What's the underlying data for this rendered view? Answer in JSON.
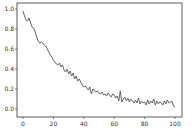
{
  "chart_data": {
    "type": "line",
    "title": "",
    "xlabel": "",
    "ylabel": "",
    "xlim": [
      -5,
      105
    ],
    "ylim": [
      -0.04,
      1.06
    ],
    "xticks": [
      0,
      20,
      40,
      60,
      80,
      100
    ],
    "xtick_labels": [
      "0",
      "20",
      "40",
      "60",
      "80",
      "100"
    ],
    "yticks": [
      0.0,
      0.2,
      0.4,
      0.6,
      0.8,
      1.0
    ],
    "ytick_labels": [
      "0.0",
      "0.2",
      "0.4",
      "0.6",
      "0.8",
      "1.0"
    ],
    "grid": false,
    "legend": null,
    "series": [
      {
        "name": "series",
        "color": "#555555",
        "x": [
          0,
          1,
          2,
          3,
          4,
          5,
          6,
          7,
          8,
          9,
          10,
          11,
          12,
          13,
          14,
          15,
          16,
          17,
          18,
          19,
          20,
          21,
          22,
          23,
          24,
          25,
          26,
          27,
          28,
          29,
          30,
          31,
          32,
          33,
          34,
          35,
          36,
          37,
          38,
          39,
          40,
          41,
          42,
          43,
          44,
          45,
          46,
          47,
          48,
          49,
          50,
          51,
          52,
          53,
          54,
          55,
          56,
          57,
          58,
          59,
          60,
          61,
          62,
          63,
          64,
          65,
          66,
          67,
          68,
          69,
          70,
          71,
          72,
          73,
          74,
          75,
          76,
          77,
          78,
          79,
          80,
          81,
          82,
          83,
          84,
          85,
          86,
          87,
          88,
          89,
          90,
          91,
          92,
          93,
          94,
          95,
          96,
          97,
          98,
          99,
          100
        ],
        "values": [
          0.98,
          0.93,
          0.89,
          0.88,
          0.91,
          0.86,
          0.82,
          0.81,
          0.77,
          0.72,
          0.68,
          0.66,
          0.67,
          0.66,
          0.64,
          0.63,
          0.6,
          0.57,
          0.54,
          0.52,
          0.49,
          0.47,
          0.45,
          0.44,
          0.46,
          0.42,
          0.44,
          0.39,
          0.37,
          0.4,
          0.35,
          0.38,
          0.33,
          0.36,
          0.3,
          0.33,
          0.28,
          0.3,
          0.27,
          0.24,
          0.22,
          0.23,
          0.21,
          0.19,
          0.22,
          0.15,
          0.2,
          0.18,
          0.17,
          0.18,
          0.16,
          0.15,
          0.17,
          0.14,
          0.15,
          0.13,
          0.16,
          0.14,
          0.12,
          0.15,
          0.14,
          0.11,
          0.13,
          0.08,
          0.18,
          0.07,
          0.1,
          0.12,
          0.08,
          0.11,
          0.07,
          0.1,
          0.08,
          0.06,
          0.09,
          0.06,
          0.11,
          0.05,
          0.08,
          0.06,
          0.07,
          0.04,
          0.09,
          0.05,
          0.08,
          0.06,
          0.1,
          0.04,
          0.08,
          0.05,
          0.07,
          0.06,
          0.04,
          0.08,
          0.05,
          0.09,
          0.06,
          0.07,
          0.08,
          0.03,
          0.02
        ]
      }
    ]
  },
  "axes": {
    "frame_color": "#333333",
    "line_color": "#555555"
  }
}
